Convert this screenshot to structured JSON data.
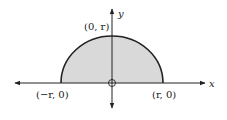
{
  "diagram": {
    "colors": {
      "fill": "#d9d9d9",
      "stroke": "#222222",
      "axis": "#222222",
      "background": "#ffffff"
    },
    "axes": {
      "x_label": "x",
      "y_label": "y"
    },
    "points": [
      {
        "id": "top",
        "label": "(0, r)"
      },
      {
        "id": "left",
        "label": "(−r, 0)"
      },
      {
        "id": "right",
        "label": "(r, 0)"
      }
    ],
    "origin_marker": "open-circle"
  }
}
